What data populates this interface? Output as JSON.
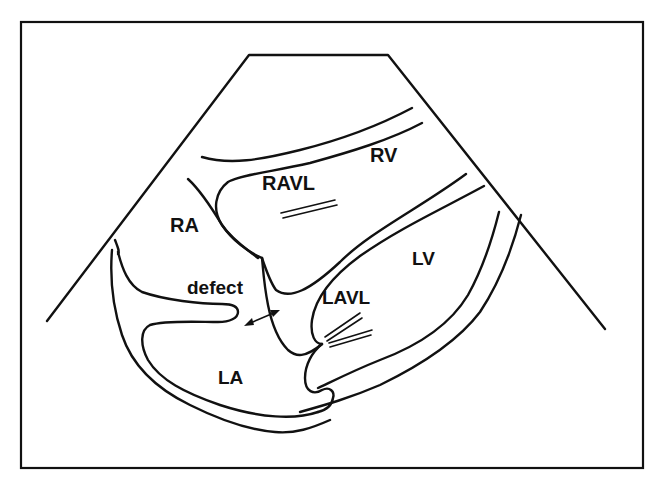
{
  "diagram": {
    "type": "echocardiogram-schematic",
    "view": "apical four-chamber sector",
    "labels": {
      "rv": "RV",
      "ravl": "RAVL",
      "ra": "RA",
      "lv": "LV",
      "defect": "defect",
      "lavl": "LAVL",
      "la": "LA"
    },
    "colors": {
      "line": "#111111",
      "background": "#ffffff"
    }
  }
}
